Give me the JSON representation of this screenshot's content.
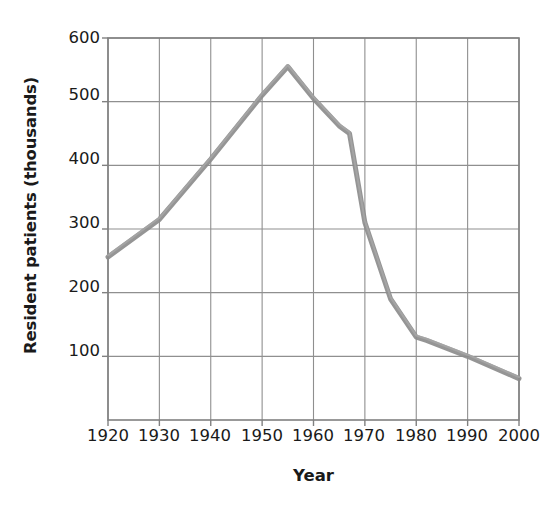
{
  "chart_data": {
    "type": "line",
    "title": "",
    "xlabel": "Year",
    "ylabel": "Resident patients (thousands)",
    "xlim": [
      1920,
      2000
    ],
    "ylim": [
      0,
      600
    ],
    "xtick_labels": [
      "1920",
      "1930",
      "1940",
      "1950",
      "1960",
      "1970",
      "1980",
      "1990",
      "2000"
    ],
    "xticks": [
      1920,
      1930,
      1940,
      1950,
      1960,
      1970,
      1980,
      1990,
      2000
    ],
    "ytick_labels": [
      "100",
      "200",
      "300",
      "400",
      "500",
      "600"
    ],
    "yticks": [
      100,
      200,
      300,
      400,
      500,
      600
    ],
    "grid": true,
    "legend": "none",
    "line_color": "#8c8c8c",
    "axis_color": "#808080",
    "series": [
      {
        "name": "Resident patients",
        "x": [
          1920,
          1930,
          1940,
          1950,
          1955,
          1960,
          1965,
          1967,
          1970,
          1975,
          1980,
          1982,
          1990,
          2000
        ],
        "values": [
          256,
          315,
          410,
          510,
          555,
          505,
          462,
          450,
          310,
          190,
          130,
          125,
          100,
          65
        ]
      }
    ]
  }
}
